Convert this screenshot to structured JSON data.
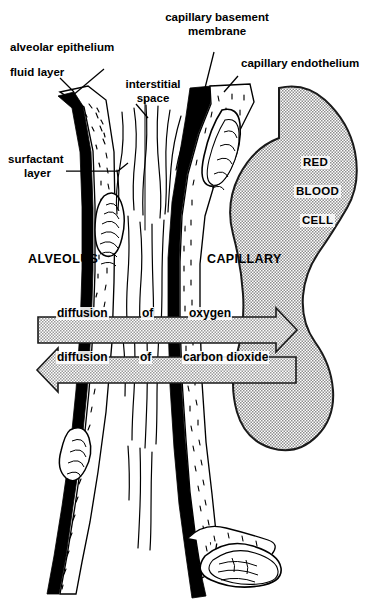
{
  "figure": {
    "background_color": "#ffffff",
    "ink_color": "#000000",
    "rbc_fill_color": "#b5b5b5",
    "arrow_fill_color": "#b0b0b0",
    "membrane_color": "#000000"
  },
  "labels": {
    "alveolar_epithelium": "alveolar epithelium",
    "fluid_layer": "fluid layer",
    "surfactant_layer_line1": "surfactant",
    "surfactant_layer_line2": "layer",
    "interstitial_space_line1": "interstitial",
    "interstitial_space_line2": "space",
    "capillary_basement_membrane_line1": "capillary basement",
    "capillary_basement_membrane_line2": "membrane",
    "capillary_endothelium": "capillary endothelium",
    "alveolus": "ALVEOLUS",
    "capillary": "CAPILLARY",
    "rbc_line1": "RED",
    "rbc_line2": "BLOOD",
    "rbc_line3": "CELL"
  },
  "arrows": {
    "oxygen": {
      "text_parts": [
        "diffusion",
        "of",
        "oxygen"
      ],
      "full_text": "diffusion of oxygen",
      "direction": "right"
    },
    "carbon_dioxide": {
      "text_parts": [
        "diffusion",
        "of",
        "carbon dioxide"
      ],
      "full_text": "diffusion of carbon dioxide",
      "direction": "left"
    }
  }
}
